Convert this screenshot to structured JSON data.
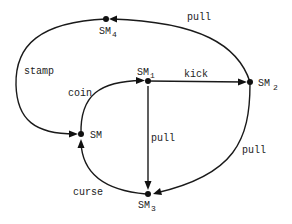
{
  "diagram": {
    "type": "state-transition-graph",
    "nodes": [
      {
        "id": "SM",
        "label": "SM",
        "subscript": ""
      },
      {
        "id": "SM1",
        "label": "SM",
        "subscript": "1"
      },
      {
        "id": "SM2",
        "label": "SM",
        "subscript": "2"
      },
      {
        "id": "SM3",
        "label": "SM",
        "subscript": "3"
      },
      {
        "id": "SM4",
        "label": "SM",
        "subscript": "4"
      }
    ],
    "edges": [
      {
        "from": "SM",
        "to": "SM1",
        "label": "coin"
      },
      {
        "from": "SM1",
        "to": "SM2",
        "label": "kick"
      },
      {
        "from": "SM1",
        "to": "SM3",
        "label": "pull"
      },
      {
        "from": "SM2",
        "to": "SM4",
        "label": "pull"
      },
      {
        "from": "SM2",
        "to": "SM3",
        "label": "pull"
      },
      {
        "from": "SM4",
        "to": "SM",
        "label": "stamp"
      },
      {
        "from": "SM3",
        "to": "SM",
        "label": "curse"
      }
    ]
  }
}
